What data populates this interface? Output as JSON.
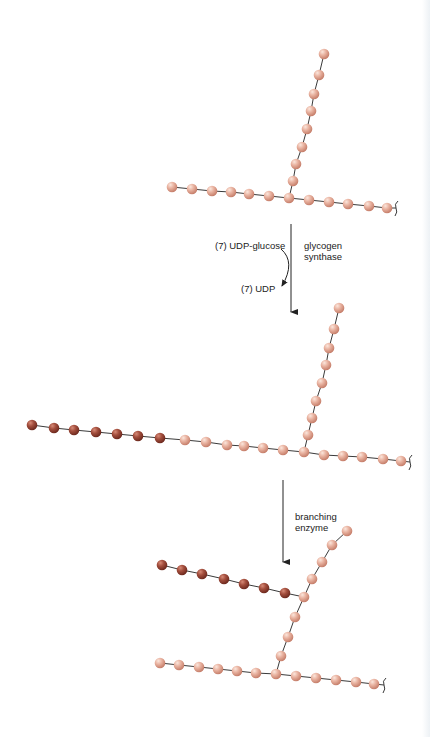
{
  "colors": {
    "old_glucose": "#e3a693",
    "old_glucose_highlight": "#f8dcd0",
    "new_glucose": "#9a4536",
    "new_glucose_highlight": "#d98a77",
    "bond": "#3a3a3a",
    "arrow": "#222222",
    "text": "#222222"
  },
  "step1": {
    "substrate_label": "(7) UDP-glucose",
    "product_label": "(7) UDP",
    "enzyme_label_line1": "glycogen",
    "enzyme_label_line2": "synthase"
  },
  "step2": {
    "enzyme_label_line1": "branching",
    "enzyme_label_line2": "enzyme"
  },
  "panels": [
    {
      "name": "initial-glycogen",
      "main_chain": [
        [
          172,
          187
        ],
        [
          192,
          189
        ],
        [
          212,
          191
        ],
        [
          231,
          192
        ],
        [
          249,
          194
        ],
        [
          269,
          196
        ],
        [
          289,
          198
        ],
        [
          309,
          200
        ],
        [
          329,
          202
        ],
        [
          348,
          204
        ],
        [
          369,
          206
        ],
        [
          387,
          208
        ]
      ],
      "branch": [
        [
          289,
          198
        ],
        [
          293,
          181
        ],
        [
          296,
          164
        ],
        [
          302,
          147
        ],
        [
          307,
          129
        ],
        [
          311,
          111
        ],
        [
          314,
          94
        ],
        [
          319,
          75
        ],
        [
          324,
          54
        ]
      ],
      "new_residues": [],
      "end_bracket": [
        396,
        208
      ]
    },
    {
      "name": "elongated-glycogen",
      "main_chain": [
        [
          32,
          425
        ],
        [
          54,
          428
        ],
        [
          74,
          430
        ],
        [
          96,
          432
        ],
        [
          117,
          434
        ],
        [
          138,
          436
        ],
        [
          160,
          438
        ],
        [
          185,
          440
        ],
        [
          206,
          442
        ],
        [
          227,
          445
        ],
        [
          244,
          446
        ],
        [
          263,
          448
        ],
        [
          283,
          450
        ],
        [
          304,
          452
        ],
        [
          324,
          455
        ],
        [
          343,
          456
        ],
        [
          362,
          457
        ],
        [
          383,
          459
        ],
        [
          401,
          461
        ]
      ],
      "branch": [
        [
          304,
          452
        ],
        [
          308,
          435
        ],
        [
          312,
          418
        ],
        [
          316,
          401
        ],
        [
          322,
          383
        ],
        [
          326,
          365
        ],
        [
          329,
          348
        ],
        [
          334,
          329
        ],
        [
          339,
          308
        ]
      ],
      "new_residues": [
        0,
        1,
        2,
        3,
        4,
        5,
        6
      ],
      "end_bracket": [
        410,
        462
      ]
    },
    {
      "name": "branched-glycogen",
      "main_chain": [
        [
          160,
          663
        ],
        [
          179,
          665
        ],
        [
          199,
          667
        ],
        [
          218,
          669
        ],
        [
          237,
          671
        ],
        [
          256,
          673
        ],
        [
          276,
          674
        ],
        [
          296,
          676
        ],
        [
          316,
          678
        ],
        [
          336,
          680
        ],
        [
          356,
          682
        ],
        [
          374,
          684
        ]
      ],
      "branch": [
        [
          276,
          674
        ],
        [
          281,
          656
        ],
        [
          288,
          637
        ],
        [
          295,
          617
        ],
        [
          304,
          597
        ],
        [
          312,
          579
        ],
        [
          322,
          562
        ],
        [
          332,
          545
        ],
        [
          347,
          531
        ]
      ],
      "new_branch": [
        [
          162,
          565
        ],
        [
          182,
          570
        ],
        [
          202,
          574
        ],
        [
          224,
          579
        ],
        [
          244,
          584
        ],
        [
          264,
          588
        ],
        [
          285,
          593
        ],
        [
          304,
          597
        ]
      ],
      "new_residues": [],
      "end_bracket": [
        384,
        685
      ]
    }
  ]
}
